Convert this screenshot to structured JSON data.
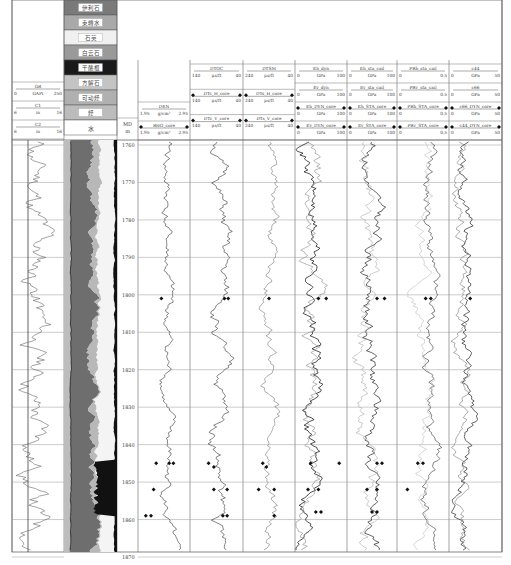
{
  "chart_data": {
    "type": "line",
    "title": "",
    "depth": {
      "label": "MD",
      "unit": "m",
      "min": 1760,
      "max": 1870,
      "ticks": [
        1760,
        1770,
        1780,
        1790,
        1800,
        1810,
        1820,
        1830,
        1840,
        1850,
        1860,
        1870
      ]
    },
    "lithology_legend": [
      {
        "label": "伊利石",
        "color": "#7a7a7a"
      },
      {
        "label": "束缚水",
        "color": "#a9a9a9"
      },
      {
        "label": "石英",
        "color": "#f0f0f0"
      },
      {
        "label": "白云石",
        "color": "#9a9a9a"
      },
      {
        "label": "干酪根",
        "color": "#1a1a1a"
      },
      {
        "label": "方解石",
        "color": "#c4c4c4"
      },
      {
        "label": "可动烃",
        "color": "#b0b0b0"
      },
      {
        "label": "烃",
        "color": "#bcbcbc"
      },
      {
        "label": "水",
        "color": "#ffffff"
      }
    ],
    "lithology_track_label": "水",
    "tracks": [
      {
        "id": "gr",
        "curves": [
          {
            "name": "GR",
            "unit": "GAPI",
            "min": "0",
            "max": "250"
          },
          {
            "name": "C1",
            "unit": "in",
            "min": "6",
            "max": "16"
          },
          {
            "name": "C2",
            "unit": "in",
            "min": "6",
            "max": "16"
          }
        ]
      },
      {
        "id": "den",
        "curves": [
          {
            "name": "DEN",
            "unit": "g/cm³",
            "min": "1.95",
            "max": "2.95"
          },
          {
            "name": "RHO_core",
            "unit": "g/cm³",
            "min": "1.95",
            "max": "2.95"
          }
        ]
      },
      {
        "id": "dtc",
        "curves": [
          {
            "name": "DTOC",
            "unit": "μs/ft",
            "min": "140",
            "max": "40"
          },
          {
            "name": "DTc_H_core",
            "unit": "μs/ft",
            "min": "140",
            "max": "40"
          },
          {
            "name": "DTc_V_core",
            "unit": "μs/ft",
            "min": "140",
            "max": "40"
          }
        ]
      },
      {
        "id": "dts",
        "curves": [
          {
            "name": "DTSM",
            "unit": "μs/ft",
            "min": "240",
            "max": "40"
          },
          {
            "name": "DTs_H_core",
            "unit": "μs/ft",
            "min": "240",
            "max": "40"
          },
          {
            "name": "DTs_V_core",
            "unit": "μs/ft",
            "min": "240",
            "max": "40"
          }
        ]
      },
      {
        "id": "edyn",
        "curves": [
          {
            "name": "Eh_dyn",
            "unit": "GPa",
            "min": "0",
            "max": "100"
          },
          {
            "name": "Ev_dyn",
            "unit": "GPa",
            "min": "0",
            "max": "100"
          },
          {
            "name": "Eh_DYN_core",
            "unit": "GPa",
            "min": "0",
            "max": "100"
          },
          {
            "name": "Ev_DYN_core",
            "unit": "GPa",
            "min": "0",
            "max": "100"
          }
        ]
      },
      {
        "id": "esta",
        "curves": [
          {
            "name": "Eh_sta_cail",
            "unit": "GPa",
            "min": "0",
            "max": "100"
          },
          {
            "name": "Ev_sta_cail",
            "unit": "GPa",
            "min": "0",
            "max": "100"
          },
          {
            "name": "Eh_STA_core",
            "unit": "GPa",
            "min": "0",
            "max": "100"
          },
          {
            "name": "Ev_STA_core",
            "unit": "GPa",
            "min": "0",
            "max": "100"
          }
        ]
      },
      {
        "id": "pr",
        "curves": [
          {
            "name": "PRh_sta_cail",
            "unit": "",
            "min": "0",
            "max": "0.5"
          },
          {
            "name": "PRv_sta_cail",
            "unit": "",
            "min": "0",
            "max": "0.5"
          },
          {
            "name": "PRh_STA_core",
            "unit": "",
            "min": "0",
            "max": "0.5"
          },
          {
            "name": "PRv_STA_core",
            "unit": "",
            "min": "0",
            "max": "0.5"
          }
        ]
      },
      {
        "id": "cij",
        "curves": [
          {
            "name": "c44",
            "unit": "GPa",
            "min": "0",
            "max": "50"
          },
          {
            "name": "c66",
            "unit": "GPa",
            "min": "0",
            "max": "50"
          },
          {
            "name": "c66_DYN_core",
            "unit": "GPa",
            "min": "0",
            "max": "50"
          },
          {
            "name": "c44_DYN_core",
            "unit": "GPa",
            "min": "0",
            "max": "50"
          }
        ]
      }
    ],
    "core_points": [
      {
        "track": "den",
        "depth": 1801,
        "x": 0.45
      },
      {
        "track": "den",
        "depth": 1845,
        "x": 0.35
      },
      {
        "track": "den",
        "depth": 1845,
        "x": 0.6
      },
      {
        "track": "den",
        "depth": 1845,
        "x": 0.68
      },
      {
        "track": "den",
        "depth": 1852,
        "x": 0.3
      },
      {
        "track": "den",
        "depth": 1859,
        "x": 0.15
      },
      {
        "track": "den",
        "depth": 1859,
        "x": 0.25
      },
      {
        "track": "dtc",
        "depth": 1801,
        "x": 0.65
      },
      {
        "track": "dtc",
        "depth": 1801,
        "x": 0.72
      },
      {
        "track": "dtc",
        "depth": 1845,
        "x": 0.35
      },
      {
        "track": "dtc",
        "depth": 1846,
        "x": 0.45
      },
      {
        "track": "dtc",
        "depth": 1852,
        "x": 0.45
      },
      {
        "track": "dtc",
        "depth": 1852,
        "x": 0.7
      },
      {
        "track": "dtc",
        "depth": 1859,
        "x": 0.62
      },
      {
        "track": "dtc",
        "depth": 1859,
        "x": 0.7
      },
      {
        "track": "dts",
        "depth": 1801,
        "x": 0.5
      },
      {
        "track": "dts",
        "depth": 1845,
        "x": 0.38
      },
      {
        "track": "dts",
        "depth": 1846,
        "x": 0.45
      },
      {
        "track": "dts",
        "depth": 1852,
        "x": 0.3
      },
      {
        "track": "dts",
        "depth": 1852,
        "x": 0.6
      },
      {
        "track": "dts",
        "depth": 1859,
        "x": 0.6
      },
      {
        "track": "edyn",
        "depth": 1801,
        "x": 0.45
      },
      {
        "track": "edyn",
        "depth": 1801,
        "x": 0.6
      },
      {
        "track": "edyn",
        "depth": 1845,
        "x": 0.3
      },
      {
        "track": "edyn",
        "depth": 1845,
        "x": 0.85
      },
      {
        "track": "edyn",
        "depth": 1852,
        "x": 0.25
      },
      {
        "track": "edyn",
        "depth": 1852,
        "x": 0.45
      },
      {
        "track": "edyn",
        "depth": 1858,
        "x": 0.4
      },
      {
        "track": "edyn",
        "depth": 1858,
        "x": 0.5
      },
      {
        "track": "esta",
        "depth": 1801,
        "x": 0.6
      },
      {
        "track": "esta",
        "depth": 1801,
        "x": 0.75
      },
      {
        "track": "esta",
        "depth": 1845,
        "x": 0.6
      },
      {
        "track": "esta",
        "depth": 1845,
        "x": 0.7
      },
      {
        "track": "esta",
        "depth": 1852,
        "x": 0.4
      },
      {
        "track": "esta",
        "depth": 1852,
        "x": 0.6
      },
      {
        "track": "esta",
        "depth": 1858,
        "x": 0.5
      },
      {
        "track": "esta",
        "depth": 1858,
        "x": 0.6
      },
      {
        "track": "pr",
        "depth": 1801,
        "x": 0.55
      },
      {
        "track": "pr",
        "depth": 1801,
        "x": 0.65
      },
      {
        "track": "pr",
        "depth": 1845,
        "x": 0.4
      },
      {
        "track": "pr",
        "depth": 1845,
        "x": 0.5
      },
      {
        "track": "pr",
        "depth": 1852,
        "x": 0.2
      },
      {
        "track": "cij",
        "depth": 1801,
        "x": 0.4
      }
    ],
    "legend_position": "top",
    "grid": true
  }
}
